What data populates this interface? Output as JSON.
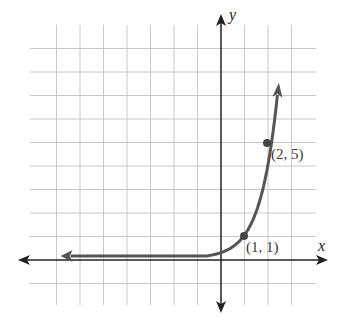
{
  "chart_data": {
    "type": "line",
    "title": "",
    "xlabel": "x",
    "ylabel": "y",
    "function": "y = 4^(x-1)",
    "xlim": [
      -8,
      4
    ],
    "ylim": [
      -2,
      9
    ],
    "grid": true,
    "series": [
      {
        "name": "exponential curve",
        "x": [
          -8,
          -4,
          -2,
          -1,
          0,
          0.5,
          1,
          1.5,
          2,
          2.2
        ],
        "y": [
          0.0,
          0.0,
          0.02,
          0.06,
          0.25,
          0.5,
          1,
          2,
          5,
          9
        ]
      }
    ],
    "points": [
      {
        "x": 1,
        "y": 1,
        "label": "(1, 1)"
      },
      {
        "x": 2,
        "y": 5,
        "label": "(2, 5)"
      }
    ],
    "annotations": [
      "(1, 1)",
      "(2, 5)"
    ],
    "colors": {
      "grid": "#c8c8c8",
      "axis": "#222222",
      "curve": "#555555",
      "label": "#3a3a3a"
    }
  }
}
